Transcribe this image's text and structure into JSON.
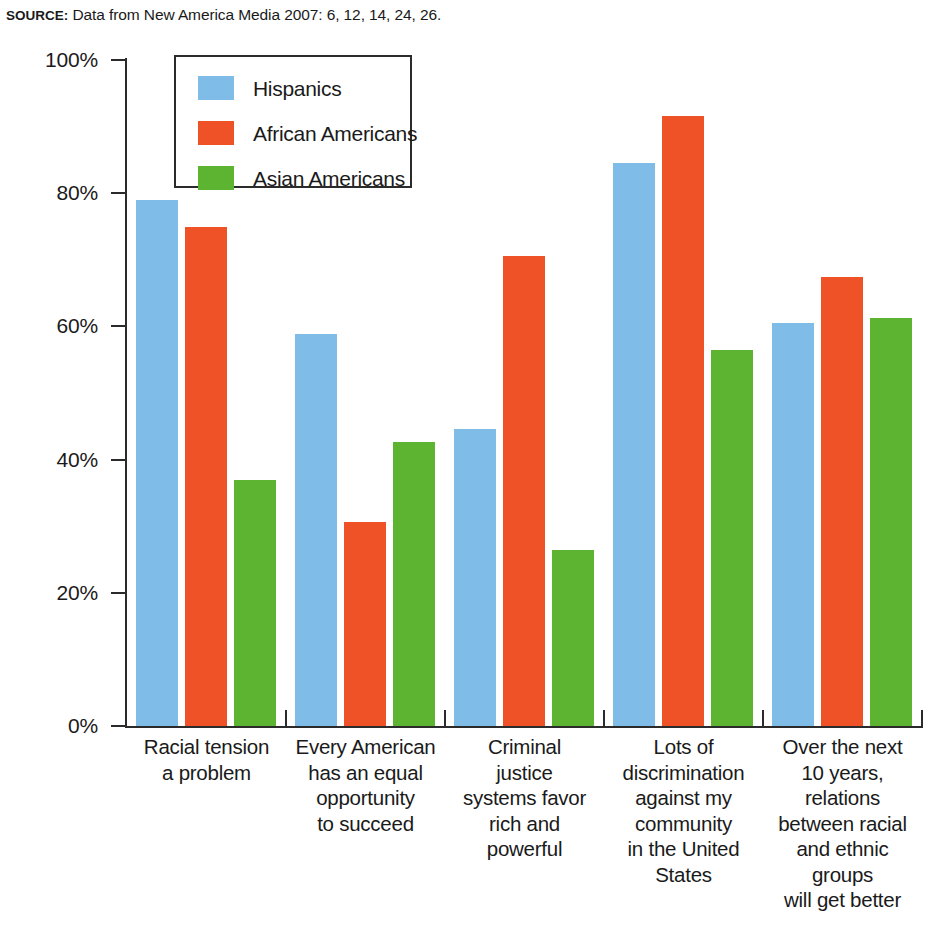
{
  "source": {
    "label": "SOURCE:",
    "text": " Data from New America Media 2007: 6, 12, 14, 24, 26."
  },
  "legend": {
    "entries": [
      {
        "label": "Hispanics",
        "color": "#7fbde8",
        "swatch": "legend-swatch-hispanics"
      },
      {
        "label": "African Americans",
        "color": "#f05228",
        "swatch": "legend-swatch-african-americans"
      },
      {
        "label": "Asian Americans",
        "color": "#5cb431",
        "swatch": "legend-swatch-asian-americans"
      }
    ]
  },
  "axes": {
    "y_ticks": [
      "0%",
      "20%",
      "40%",
      "60%",
      "80%",
      "100%"
    ],
    "y_min": 0,
    "y_max": 100,
    "y_step": 20
  },
  "chart_data": {
    "type": "bar",
    "title": "",
    "subtitle": "",
    "xlabel": "",
    "ylabel": "",
    "ylim": [
      0,
      100
    ],
    "yticks": [
      0,
      20,
      40,
      60,
      80,
      100
    ],
    "ytick_labels": [
      "0%",
      "20%",
      "40%",
      "60%",
      "80%",
      "100%"
    ],
    "grid": false,
    "legend_position": "top-left-inside",
    "units": "percent",
    "categories": [
      "Racial tension\na problem",
      "Every American\nhas an equal\nopportunity\nto succeed",
      "Criminal\njustice\nsystems favor\nrich and\npowerful",
      "Lots of\ndiscrimination\nagainst my\ncommunity\nin the United\nStates",
      "Over the next\n10 years,\nrelations\nbetween racial\nand ethnic\ngroups\nwill get better"
    ],
    "category_lines": [
      [
        "Racial tension",
        "a problem"
      ],
      [
        "Every American",
        "has an equal",
        "opportunity",
        "to succeed"
      ],
      [
        "Criminal",
        "justice",
        "systems favor",
        "rich and",
        "powerful"
      ],
      [
        "Lots of",
        "discrimination",
        "against my",
        "community",
        "in the United",
        "States"
      ],
      [
        "Over the next",
        "10 years,",
        "relations",
        "between racial",
        "and ethnic",
        "groups",
        "will get better"
      ]
    ],
    "series": [
      {
        "name": "Hispanics",
        "color": "#7fbde8",
        "values": [
          79.0,
          58.8,
          44.6,
          84.5,
          60.5
        ]
      },
      {
        "name": "African Americans",
        "color": "#f05228",
        "values": [
          75.0,
          30.7,
          70.6,
          91.6,
          67.4
        ]
      },
      {
        "name": "Asian Americans",
        "color": "#5cb431",
        "values": [
          37.0,
          42.6,
          26.5,
          56.5,
          61.3
        ]
      }
    ]
  }
}
